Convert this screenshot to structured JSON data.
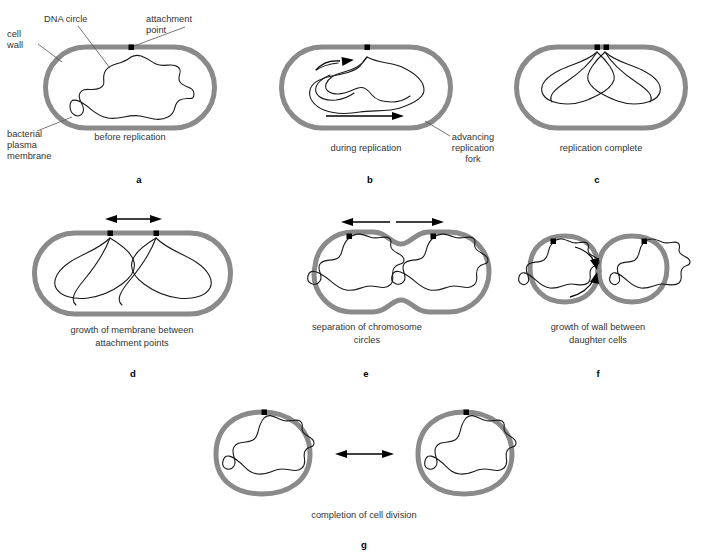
{
  "figure": {
    "colors": {
      "background": "#ffffff",
      "cell_wall": "#8a8a8a",
      "dna_strand": "#1a1a1a",
      "attachment_point": "#000000",
      "arrow": "#000000",
      "leader_line": "#555555",
      "label_text": "#333333",
      "panel_letter": "#000000"
    },
    "callouts": [
      {
        "id": "cell-wall",
        "lines": [
          "cell",
          "wall"
        ]
      },
      {
        "id": "dna-circle",
        "lines": [
          "DNA circle"
        ]
      },
      {
        "id": "attachment-point",
        "lines": [
          "attachment",
          "point"
        ]
      },
      {
        "id": "bacterial-plasma-membrane",
        "lines": [
          "bacterial",
          "plasma",
          "membrane"
        ]
      },
      {
        "id": "advancing-replication-fork",
        "lines": [
          "advancing",
          "replication",
          "fork"
        ]
      }
    ],
    "panels": [
      {
        "letter": "a",
        "caption_lines": [
          "before replication"
        ],
        "shape": "rod",
        "attachment_points": 1,
        "arrows": []
      },
      {
        "letter": "b",
        "caption_lines": [
          "during replication"
        ],
        "shape": "rod",
        "attachment_points": 1,
        "arrows": [
          "left-curved",
          "right-straight"
        ]
      },
      {
        "letter": "c",
        "caption_lines": [
          "replication complete"
        ],
        "shape": "rod",
        "attachment_points": 2,
        "arrows": []
      },
      {
        "letter": "d",
        "caption_lines": [
          "growth of membrane between",
          "attachment points"
        ],
        "shape": "rod",
        "attachment_points": 2,
        "arrows": [
          "double-headed"
        ]
      },
      {
        "letter": "e",
        "caption_lines": [
          "separation of chromosome",
          "circles"
        ],
        "shape": "constricting",
        "attachment_points": 2,
        "arrows": [
          "left",
          "right"
        ]
      },
      {
        "letter": "f",
        "caption_lines": [
          "growth of wall between",
          "daughter cells"
        ],
        "shape": "pinched",
        "attachment_points": 2,
        "arrows": [
          "curved-down",
          "curved-up"
        ]
      },
      {
        "letter": "g",
        "caption_lines": [
          "completion of cell division"
        ],
        "shape": "two-round-cells",
        "attachment_points": 2,
        "arrows": [
          "double-headed-separation"
        ]
      }
    ]
  }
}
